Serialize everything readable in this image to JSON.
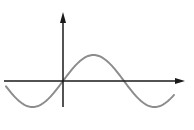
{
  "diagram": {
    "type": "sine-wave-plot",
    "colors": {
      "background": "#ffffff",
      "axis": "#1a1a1a",
      "curve": "#8c8c8c"
    },
    "axes": {
      "origin": [
        63,
        81
      ],
      "x_axis": {
        "from": [
          4,
          81
        ],
        "to": [
          185,
          81
        ],
        "arrow": true
      },
      "y_axis": {
        "from": [
          63,
          107
        ],
        "to": [
          63,
          12
        ],
        "arrow": true
      }
    },
    "curve": {
      "function": "sine",
      "amplitude_px": 26,
      "period_px": 122,
      "x_start": 6,
      "x_end": 174
    }
  }
}
